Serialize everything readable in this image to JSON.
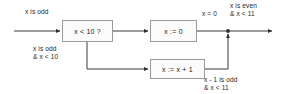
{
  "diagram": {
    "colors": {
      "background": "#ffffff",
      "box_fill": "#fbfbfb",
      "box_border": "#9a9a9a",
      "edge": "#3b3b3b",
      "text": "#1a1a1a"
    },
    "nodes": [
      {
        "id": "condition",
        "label": "x < 10 ?",
        "shape": "rect"
      },
      {
        "id": "reset",
        "label": "x := 0",
        "shape": "rect"
      },
      {
        "id": "increment",
        "label": "x := x + 1",
        "shape": "rect"
      }
    ],
    "labels": {
      "input": {
        "line1": "x is odd"
      },
      "branch_true": {
        "line1": "x is odd",
        "line2": "& x < 10"
      },
      "reset_out": {
        "line1": "x = 0"
      },
      "output": {
        "line1": "x is even",
        "line2": "& x < 11"
      },
      "incr_out": {
        "line1": "x - 1 is odd",
        "line2": "& x < 11"
      }
    },
    "edges": [
      {
        "id": "entry-to-condition",
        "from": "entry",
        "to": "condition",
        "label": "x is odd"
      },
      {
        "id": "condition-to-reset",
        "from": "condition",
        "to": "reset",
        "label": ""
      },
      {
        "id": "condition-to-incr",
        "from": "condition",
        "to": "increment",
        "label": "x is odd & x < 10"
      },
      {
        "id": "reset-to-merge",
        "from": "reset",
        "to": "merge",
        "label": "x = 0"
      },
      {
        "id": "incr-to-merge",
        "from": "increment",
        "to": "merge",
        "label": "x - 1 is odd & x < 11"
      },
      {
        "id": "merge-to-exit",
        "from": "merge",
        "to": "exit",
        "label": "x is even & x < 11"
      }
    ]
  }
}
